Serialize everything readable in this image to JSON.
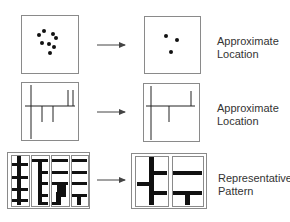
{
  "colors": {
    "stroke": "#8a8a8a",
    "ink": "#111111",
    "text": "#333333",
    "arrow": "#444444"
  },
  "rows": [
    {
      "id": "row-points",
      "label_lines": [
        "Approximate",
        "Location"
      ],
      "label_pos": [
        217,
        35
      ],
      "source": {
        "box": [
          21,
          15,
          57,
          58
        ],
        "dots": [
          [
            39,
            35
          ],
          [
            44,
            31
          ],
          [
            53,
            34
          ],
          [
            56,
            38
          ],
          [
            42,
            43
          ],
          [
            49,
            44
          ],
          [
            54,
            47
          ],
          [
            50,
            53
          ]
        ]
      },
      "result": {
        "box": [
          144,
          16,
          56,
          57
        ],
        "dots": [
          [
            166,
            36
          ],
          [
            177,
            40
          ],
          [
            171,
            52
          ]
        ]
      },
      "arrow": [
        97,
        45,
        125,
        45
      ]
    },
    {
      "id": "row-lines",
      "label_lines": [
        "Approximate",
        "Location"
      ],
      "label_pos": [
        217,
        102
      ],
      "source": {
        "box": [
          21,
          82,
          57,
          58
        ],
        "lines": [
          [
            25,
            106,
            75,
            106
          ],
          [
            31,
            85,
            31,
            139
          ],
          [
            42,
            106,
            42,
            122
          ],
          [
            53,
            106,
            53,
            122
          ],
          [
            68,
            90,
            68,
            106
          ],
          [
            73,
            90,
            73,
            106
          ]
        ]
      },
      "result": {
        "box": [
          143,
          83,
          56,
          58
        ],
        "lines": [
          [
            146,
            106,
            195,
            106
          ],
          [
            151,
            86,
            151,
            140
          ],
          [
            169,
            106,
            169,
            122
          ],
          [
            191,
            91,
            191,
            106
          ]
        ]
      },
      "arrow": [
        97,
        112,
        125,
        112
      ]
    },
    {
      "id": "row-patterns",
      "label_lines": [
        "Representative",
        "Pattern"
      ],
      "label_pos": [
        218,
        172
      ],
      "source": {
        "box": [
          7,
          152,
          82,
          56
        ],
        "panels": [
          [
            11,
            155,
            18,
            51
          ],
          [
            31,
            155,
            18,
            51
          ],
          [
            51,
            155,
            18,
            51
          ],
          [
            71,
            155,
            17,
            51
          ]
        ],
        "bars": [
          [
            17,
            156,
            4,
            49
          ],
          [
            12,
            163,
            16,
            3
          ],
          [
            12,
            176,
            16,
            3
          ],
          [
            12,
            188,
            16,
            3
          ],
          [
            12,
            199,
            16,
            3
          ],
          [
            38,
            159,
            4,
            45
          ],
          [
            32,
            159,
            16,
            3
          ],
          [
            38,
            171,
            10,
            3
          ],
          [
            38,
            182,
            10,
            3
          ],
          [
            38,
            194,
            10,
            3
          ],
          [
            38,
            202,
            10,
            3
          ],
          [
            52,
            159,
            16,
            3
          ],
          [
            52,
            171,
            16,
            3
          ],
          [
            52,
            182,
            16,
            3
          ],
          [
            57,
            184,
            9,
            13
          ],
          [
            56,
            192,
            5,
            11
          ],
          [
            52,
            202,
            9,
            3
          ],
          [
            72,
            159,
            15,
            3
          ],
          [
            72,
            171,
            15,
            3
          ],
          [
            72,
            182,
            15,
            3
          ],
          [
            72,
            194,
            15,
            3
          ],
          [
            77,
            194,
            4,
            11
          ]
        ]
      },
      "result": {
        "box": [
          131,
          153,
          75,
          55
        ],
        "panels": [
          [
            135,
            156,
            33,
            50
          ],
          [
            172,
            156,
            31,
            50
          ]
        ],
        "bars": [
          [
            149,
            157,
            5,
            48
          ],
          [
            137,
            182,
            13,
            4
          ],
          [
            153,
            171,
            14,
            4
          ],
          [
            153,
            191,
            14,
            4
          ],
          [
            173,
            171,
            29,
            4
          ],
          [
            173,
            191,
            29,
            4
          ],
          [
            185,
            193,
            5,
            12
          ]
        ]
      },
      "arrow": [
        97,
        180,
        125,
        180
      ]
    }
  ]
}
